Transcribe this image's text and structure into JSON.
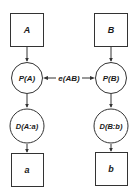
{
  "diagram": {
    "nodes": {
      "box_A": {
        "label": "A"
      },
      "box_B": {
        "label": "B"
      },
      "circle_PA": {
        "label": "P(A)"
      },
      "circle_PB": {
        "label": "P(B)"
      },
      "circle_DA": {
        "label": "D(A:a)"
      },
      "circle_DB": {
        "label": "D(B:b)"
      },
      "box_a": {
        "label": "a"
      },
      "box_b": {
        "label": "b"
      }
    },
    "edges": {
      "entanglement": {
        "label": "e(AB)"
      }
    },
    "colors": {
      "stroke": "#333333",
      "background": "#ffffff",
      "text": "#1a1a1a"
    }
  }
}
